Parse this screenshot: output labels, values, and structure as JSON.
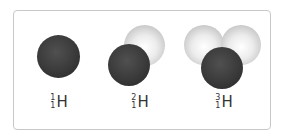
{
  "diagram": {
    "isotopes": [
      {
        "mass": "1",
        "atomic": "1",
        "symbol": "H",
        "protons": 1,
        "neutrons": 0
      },
      {
        "mass": "2",
        "atomic": "1",
        "symbol": "H",
        "protons": 1,
        "neutrons": 1
      },
      {
        "mass": "3",
        "atomic": "1",
        "symbol": "H",
        "protons": 1,
        "neutrons": 2
      }
    ],
    "colors": {
      "proton": "#333333",
      "neutron": "#e0e0e0",
      "border": "#c8c8c8"
    }
  }
}
